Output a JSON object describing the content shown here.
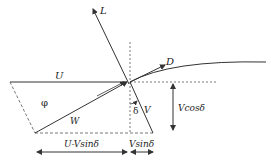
{
  "diagram": {
    "type": "velocity-force-triangle",
    "labels": {
      "lift": "L",
      "drag": "D",
      "blade_speed": "U",
      "relative_velocity": "W",
      "velocity": "V",
      "angle_phi": "φ",
      "angle_delta": "δ",
      "v_cos": "Vcosδ",
      "u_minus": "U-Vsinδ",
      "v_sin": "Vsinδ"
    },
    "colors": {
      "line": "#333333",
      "background": "#ffffff"
    }
  }
}
